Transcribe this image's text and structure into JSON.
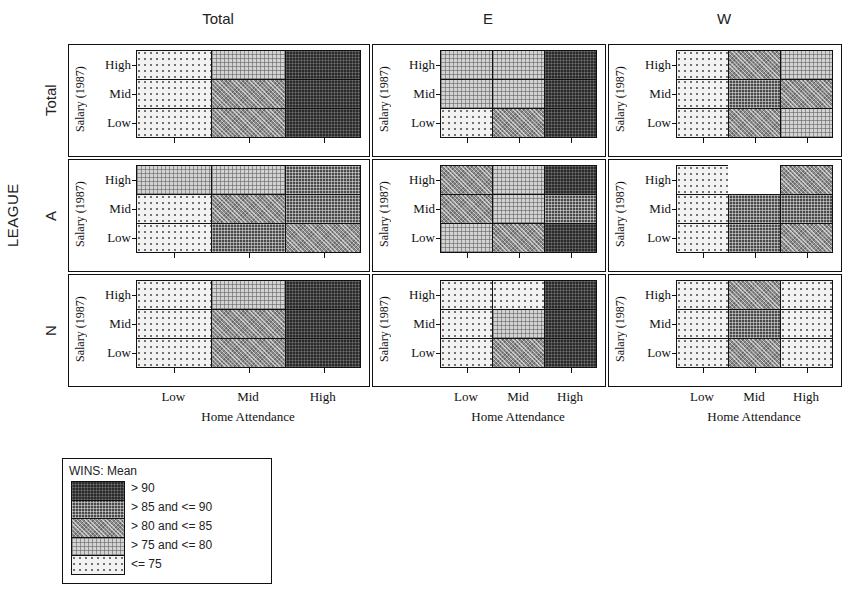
{
  "chart_data": {
    "type": "heatmap",
    "title": "WINS: Mean",
    "xlabel": "Home Attendance",
    "ylabel": "Salary (1987)",
    "row_group_label": "LEAGUE",
    "x_categories": [
      "Low",
      "Mid",
      "High"
    ],
    "y_categories": [
      "High",
      "Mid",
      "Low"
    ],
    "column_strips": [
      "Total",
      "E",
      "W"
    ],
    "row_strips": [
      "Total",
      "A",
      "N"
    ],
    "bins": [
      {
        "index": 0,
        "label": "> 90",
        "fill": "f0",
        "color": "#2a2a2a"
      },
      {
        "index": 1,
        "label": "> 85 and <= 90",
        "fill": "f1",
        "color": "#4a4a4a"
      },
      {
        "index": 2,
        "label": "> 80 and <= 85",
        "fill": "f2",
        "color": "#8d8d8d"
      },
      {
        "index": 3,
        "label": "> 75 and <= 80",
        "fill": "f3",
        "color": "#d3d3d3"
      },
      {
        "index": 4,
        "label": "<= 75",
        "fill": "f4",
        "color": "#f2f2f2"
      }
    ],
    "panels": [
      {
        "row": "Total",
        "col": "Total",
        "cells": [
          [
            4,
            3,
            0
          ],
          [
            4,
            2,
            0
          ],
          [
            4,
            2,
            0
          ]
        ]
      },
      {
        "row": "Total",
        "col": "E",
        "cells": [
          [
            3,
            3,
            0
          ],
          [
            3,
            3,
            0
          ],
          [
            4,
            2,
            0
          ]
        ]
      },
      {
        "row": "Total",
        "col": "W",
        "cells": [
          [
            4,
            2,
            3
          ],
          [
            4,
            1,
            2
          ],
          [
            4,
            2,
            3
          ]
        ]
      },
      {
        "row": "A",
        "col": "Total",
        "cells": [
          [
            3,
            3,
            1
          ],
          [
            4,
            2,
            1
          ],
          [
            4,
            1,
            2
          ]
        ]
      },
      {
        "row": "A",
        "col": "E",
        "cells": [
          [
            2,
            3,
            0
          ],
          [
            2,
            3,
            1
          ],
          [
            3,
            2,
            0
          ]
        ]
      },
      {
        "row": "A",
        "col": "W",
        "cells": [
          [
            4,
            -1,
            2
          ],
          [
            4,
            1,
            1
          ],
          [
            4,
            1,
            2
          ]
        ]
      },
      {
        "row": "N",
        "col": "Total",
        "cells": [
          [
            4,
            3,
            0
          ],
          [
            4,
            2,
            0
          ],
          [
            4,
            2,
            0
          ]
        ]
      },
      {
        "row": "N",
        "col": "E",
        "cells": [
          [
            4,
            4,
            0
          ],
          [
            4,
            3,
            0
          ],
          [
            4,
            2,
            0
          ]
        ]
      },
      {
        "row": "N",
        "col": "W",
        "cells": [
          [
            4,
            2,
            4
          ],
          [
            4,
            1,
            4
          ],
          [
            4,
            2,
            4
          ]
        ]
      }
    ],
    "legend_position": "bottom-left",
    "grid": false
  },
  "legend": {
    "title": "WINS: Mean",
    "labels": [
      "> 90",
      "> 85 and <= 90",
      "> 80 and <= 85",
      "> 75 and <= 80",
      "<= 75"
    ]
  },
  "axes": {
    "x_title": "Home Attendance",
    "y_title": "Salary (1987)",
    "x_ticks": [
      "Low",
      "Mid",
      "High"
    ],
    "y_ticks": [
      "High",
      "Mid",
      "Low"
    ],
    "outer_row_title": "LEAGUE"
  },
  "strips": {
    "columns": [
      "Total",
      "E",
      "W"
    ],
    "rows": [
      "Total",
      "A",
      "N"
    ]
  }
}
